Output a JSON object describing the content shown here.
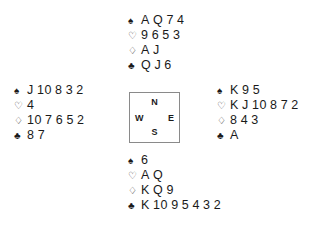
{
  "diagram": {
    "kind": "bridge-deal",
    "background_color": "#ffffff",
    "text_color": "#1a1a1a",
    "border_color": "#8a8a8a"
  },
  "suits": {
    "spade": {
      "name": "spade-icon",
      "glyph": "♠",
      "filled": true
    },
    "heart": {
      "name": "heart-icon",
      "glyph": "♡",
      "filled": false
    },
    "diamond": {
      "name": "diamond-icon",
      "glyph": "♢",
      "filled": false
    },
    "club": {
      "name": "club-icon",
      "glyph": "♣",
      "filled": true
    }
  },
  "compass": {
    "north": "N",
    "west": "W",
    "east": "E",
    "south": "S"
  },
  "hands": {
    "north": {
      "position": "North",
      "spades": "A Q 7 4",
      "hearts": "9 6 5 3",
      "diamonds": "A J",
      "clubs": "Q J 6"
    },
    "west": {
      "position": "West",
      "spades": "J 10 8 3 2",
      "hearts": "4",
      "diamonds": "10 7 6 5 2",
      "clubs": "8 7"
    },
    "east": {
      "position": "East",
      "spades": "K 9 5",
      "hearts": "K J 10 8 7 2",
      "diamonds": "8 4 3",
      "clubs": "A"
    },
    "south": {
      "position": "South",
      "spades": "6",
      "hearts": "A Q",
      "diamonds": "K Q 9",
      "clubs": "K 10 9 5 4 3 2"
    }
  }
}
